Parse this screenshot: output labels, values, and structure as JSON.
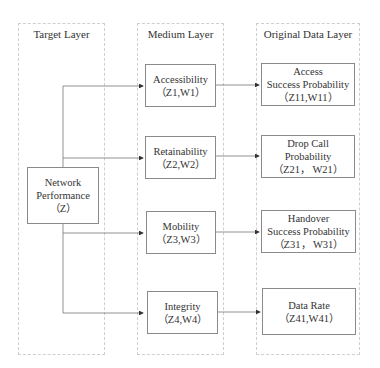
{
  "columns": [
    {
      "title": "Target Layer"
    },
    {
      "title": "Medium Layer"
    },
    {
      "title": "Original Data Layer"
    }
  ],
  "target": {
    "line1": "Network",
    "line2": "Performance",
    "line3": "（Z）"
  },
  "medium": [
    {
      "name": "Accessibility",
      "code": "（Z1,W1）"
    },
    {
      "name": "Retainability",
      "code": "（Z2,W2）"
    },
    {
      "name": "Mobility",
      "code": "（Z3,W3）"
    },
    {
      "name": "Integrity",
      "code": "（Z4,W4）"
    }
  ],
  "original": [
    {
      "line1": "Access",
      "line2": "Success Probability",
      "line3": "（Z11,W11）"
    },
    {
      "line1": "Drop Call",
      "line2": "Probability",
      "line3": "（Z21， W21）"
    },
    {
      "line1": "Handover",
      "line2": "Success Probability",
      "line3": "（Z31， W31）"
    },
    {
      "line1": "Data Rate",
      "line2": "（Z41,W41）"
    }
  ]
}
